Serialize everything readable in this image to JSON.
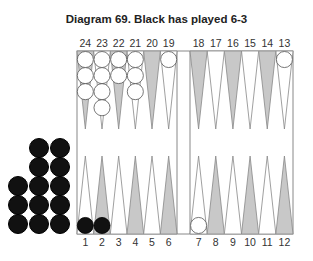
{
  "title": "Diagram 69.  Black has played 6-3",
  "colors": {
    "dark_point": "#c8c8c8",
    "light_point": "#ffffff",
    "white_checker": "#ffffff",
    "black_checker": "#111111",
    "line": "#888888"
  },
  "top_labels": [
    "24",
    "23",
    "22",
    "21",
    "20",
    "19",
    "18",
    "17",
    "16",
    "15",
    "14",
    "13"
  ],
  "bottom_labels": [
    "1",
    "2",
    "3",
    "4",
    "5",
    "6",
    "7",
    "8",
    "9",
    "10",
    "11",
    "12"
  ],
  "position": {
    "white": {
      "24": 3,
      "23": 4,
      "22": 2,
      "21": 3,
      "19": 1,
      "13": 1,
      "7": 1
    },
    "black": {
      "1": 1,
      "2": 1
    },
    "black_borne_off": 13
  }
}
